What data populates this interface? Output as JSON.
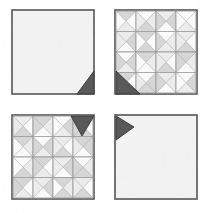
{
  "scene": {
    "title": "Quilt Panel Comparison",
    "background_color": "#ffffff",
    "panel_count": 4,
    "grid": "2x2"
  },
  "palette": {
    "panel_fill": "#f2f2f2",
    "panel_border": "#555555",
    "marker_dark": "#595959",
    "marker_border": "#3d3d3d",
    "grid_line": "#9a9a9a",
    "shade_white": "#fafafa",
    "shade_light": "#ececec",
    "shade_mid": "#d6d6d6",
    "shade_dark": "#bdbdbd"
  },
  "panels": [
    {
      "id": "panel-plain-top-left",
      "label": "Plain panel, corner marker bottom-right",
      "pattern": "plain",
      "marker": {
        "name": "corner-marker-bottom-right",
        "corner": "bottom-right",
        "direction": "left",
        "color": "#595959"
      }
    },
    {
      "id": "panel-pinwheel-top-right",
      "label": "Pinwheel quilt panel, corner marker bottom-left",
      "pattern": "pinwheel-4x4",
      "marker": {
        "name": "corner-marker-bottom-left",
        "corner": "bottom-left",
        "direction": "up-right",
        "color": "#595959"
      },
      "grid_rows": 4,
      "grid_cols": 4
    },
    {
      "id": "panel-pinwheel-bottom-left",
      "label": "Pinwheel quilt panel, corner marker top-right",
      "pattern": "pinwheel-4x4",
      "marker": {
        "name": "corner-marker-top-right",
        "corner": "top-right",
        "direction": "down",
        "color": "#595959"
      },
      "grid_rows": 4,
      "grid_cols": 4
    },
    {
      "id": "panel-plain-bottom-right",
      "label": "Plain panel, corner marker top-left",
      "pattern": "plain",
      "marker": {
        "name": "corner-marker-top-left",
        "corner": "top-left",
        "direction": "right",
        "color": "#595959"
      }
    }
  ],
  "pattern_data": {
    "cell_type": "four-triangle-pinwheel",
    "shade_codes": [
      "w",
      "l",
      "m",
      "d"
    ],
    "shade_map": {
      "w": "#fafafa",
      "l": "#ececec",
      "m": "#d6d6d6",
      "d": "#bdbdbd"
    },
    "top_right_cells": [
      [
        "m",
        "w",
        "l",
        "w"
      ],
      [
        "w",
        "l",
        "m",
        "l"
      ],
      [
        "l",
        "m",
        "w",
        "m"
      ],
      [
        "w",
        "w",
        "l",
        "w"
      ],
      [
        "l",
        "m",
        "w",
        "l"
      ],
      [
        "m",
        "w",
        "m",
        "w"
      ],
      [
        "w",
        "l",
        "l",
        "m"
      ],
      [
        "l",
        "w",
        "m",
        "l"
      ],
      [
        "w",
        "m",
        "l",
        "m"
      ],
      [
        "m",
        "l",
        "w",
        "w"
      ],
      [
        "l",
        "w",
        "m",
        "l"
      ],
      [
        "m",
        "l",
        "w",
        "m"
      ],
      [
        "m",
        "w",
        "l",
        "w"
      ],
      [
        "w",
        "m",
        "m",
        "l"
      ],
      [
        "l",
        "l",
        "w",
        "m"
      ],
      [
        "w",
        "m",
        "l",
        "w"
      ]
    ],
    "bottom_left_cells": [
      [
        "l",
        "w",
        "m",
        "l"
      ],
      [
        "m",
        "l",
        "w",
        "m"
      ],
      [
        "w",
        "m",
        "l",
        "w"
      ],
      [
        "l",
        "w",
        "m",
        "m"
      ],
      [
        "m",
        "l",
        "w",
        "w"
      ],
      [
        "w",
        "m",
        "l",
        "m"
      ],
      [
        "l",
        "w",
        "m",
        "l"
      ],
      [
        "m",
        "m",
        "w",
        "l"
      ],
      [
        "w",
        "l",
        "m",
        "w"
      ],
      [
        "m",
        "w",
        "l",
        "m"
      ],
      [
        "l",
        "m",
        "w",
        "l"
      ],
      [
        "w",
        "l",
        "m",
        "m"
      ],
      [
        "m",
        "w",
        "l",
        "m"
      ],
      [
        "l",
        "m",
        "w",
        "l"
      ],
      [
        "m",
        "l",
        "m",
        "w"
      ],
      [
        "l",
        "w",
        "m",
        "l"
      ]
    ]
  }
}
